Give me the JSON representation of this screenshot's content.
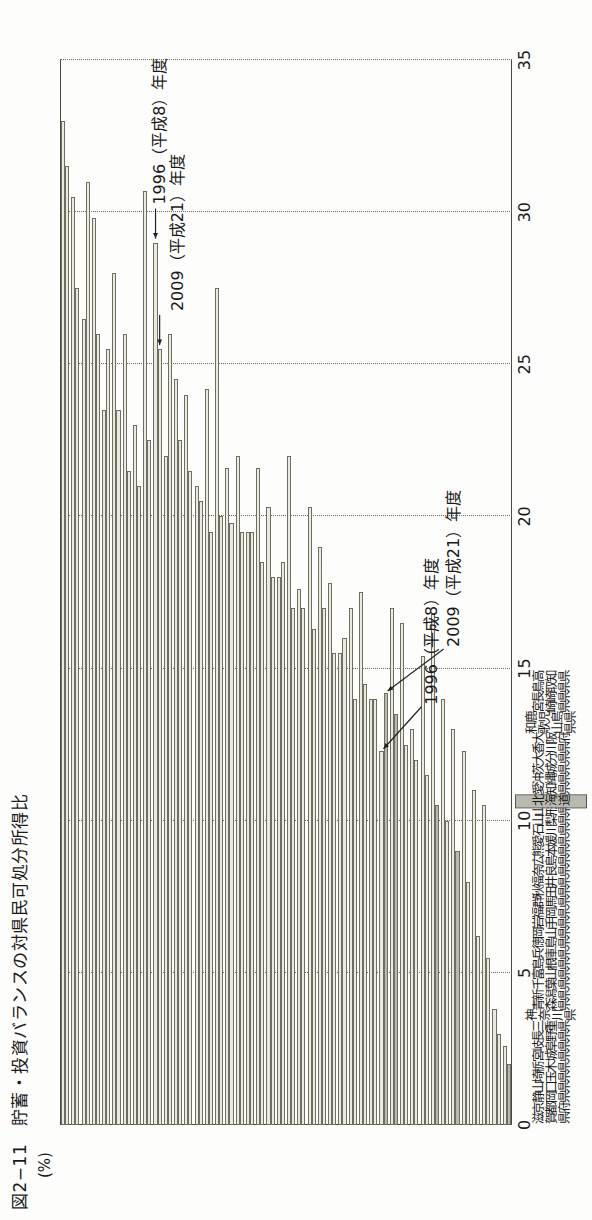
{
  "figure": {
    "title": "図2−11　貯蓄・投資バランスの対県民可処分所得比",
    "unit": "(%)"
  },
  "axis": {
    "ticks": [
      "0",
      "5",
      "10",
      "15",
      "20",
      "25",
      "30",
      "35"
    ],
    "min": 0,
    "max": 35,
    "grid": true
  },
  "annotations": {
    "a1996_top": "1996（平成8）年度",
    "a2009_top": "2009（平成21）年度",
    "a1996_hokkaido": "1996（平成8）年度",
    "a2009_hokkaido": "2009（平成21）年度"
  },
  "legend": {
    "series_1996_color": "#eceade",
    "series_2009_color": "#b9b9ad",
    "highlight_color": "#b9b9ad"
  },
  "highlight_category": "北海道",
  "chart_data": {
    "type": "bar",
    "title": "図2−11　貯蓄・投資バランスの対県民可処分所得比",
    "xlabel": "",
    "ylabel": "(%)",
    "ylim": [
      0,
      35
    ],
    "orientation": "vertical",
    "categories": [
      "滋賀県",
      "京都府",
      "静岡県",
      "山口県",
      "埼玉県",
      "栃木県",
      "宮城県",
      "岐阜県",
      "長野県",
      "三重県",
      "神奈川県",
      "青森県",
      "新潟県",
      "千葉県",
      "富山県",
      "島根県",
      "兵庫県",
      "徳島県",
      "岡山県",
      "岩手県",
      "福岡県",
      "群馬県",
      "秋田県",
      "福井県",
      "奈良県",
      "広島県",
      "熊本県",
      "愛媛県",
      "石川県",
      "山梨県",
      "山形県",
      "北海道",
      "愛知県",
      "沖縄県",
      "茨城県",
      "大分県",
      "香川県",
      "大阪府",
      "和歌山県",
      "鹿児島県",
      "宮崎県",
      "長崎県",
      "鳥取県",
      "高知県"
    ],
    "series": [
      {
        "name": "1996（平成8）年度",
        "color": "#eceade",
        "values": [
          33.0,
          30.5,
          26.5,
          29.8,
          23.5,
          28.0,
          26.0,
          23.0,
          30.7,
          29.0,
          22.0,
          24.5,
          24.0,
          21.0,
          24.2,
          27.5,
          21.6,
          22.0,
          19.5,
          21.6,
          20.3,
          18.0,
          22.0,
          17.6,
          20.3,
          19.0,
          17.8,
          15.5,
          17.0,
          17.5,
          14.0,
          12.3,
          17.0,
          16.5,
          13.0,
          15.4,
          16.8,
          14.0,
          13.0,
          12.3,
          11.0,
          10.5,
          3.8,
          2.6
        ]
      },
      {
        "name": "2009（平成21）年度",
        "color": "#b9b9ad",
        "values": [
          31.5,
          27.5,
          31.0,
          26.0,
          25.5,
          23.5,
          21.5,
          21.0,
          22.5,
          25.5,
          26.0,
          22.5,
          21.5,
          20.5,
          19.5,
          20.0,
          19.8,
          19.5,
          19.5,
          18.5,
          18.0,
          18.5,
          17.0,
          17.0,
          16.3,
          17.0,
          15.5,
          16.0,
          14.0,
          14.5,
          14.0,
          14.2,
          13.5,
          12.5,
          12.0,
          11.5,
          10.5,
          10.0,
          9.0,
          8.0,
          6.2,
          5.5,
          3.0,
          2.0
        ]
      }
    ],
    "highlighted_bars": [
      {
        "category": "北海道",
        "series": "2009（平成21）年度"
      },
      {
        "category": "愛知県",
        "series": "2009（平成21）年度"
      },
      {
        "category": "香川県",
        "series": "2009（平成21）年度"
      },
      {
        "category": "和歌山県",
        "series": "2009（平成21）年度"
      },
      {
        "category": "高知県",
        "series": "2009（平成21）年度"
      }
    ]
  }
}
